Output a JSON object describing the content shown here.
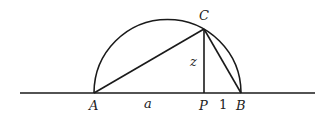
{
  "diagram": {
    "stroke_color": "#1a1a1a",
    "points": {
      "A": {
        "label": "A",
        "x": 94,
        "y": 93
      },
      "B": {
        "label": "B",
        "x": 241,
        "y": 93
      },
      "P": {
        "label": "P",
        "x": 204,
        "y": 93
      },
      "C": {
        "label": "C",
        "x": 204,
        "y": 29
      }
    },
    "segment_labels": {
      "AP": "a",
      "PB": "1",
      "CP": "z"
    }
  }
}
